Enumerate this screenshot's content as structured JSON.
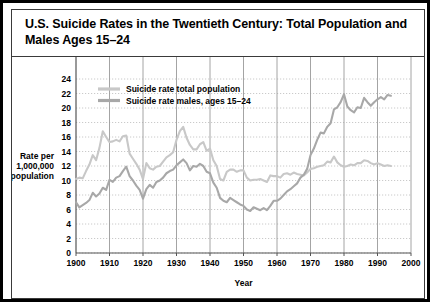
{
  "figure": {
    "title": "U.S. Suicide Rates in the Twentieth Century: Total Population and Males Ages 15–24"
  },
  "chart_data": {
    "type": "line",
    "title": "U.S. Suicide Rates in the Twentieth Century: Total Population and Males Ages 15–24",
    "xlabel": "Year",
    "ylabel": "Rate per 1,000,000 population",
    "ylabel_lines": [
      "Rate per",
      "1,000,000",
      "population"
    ],
    "xlim": [
      1900,
      2000
    ],
    "ylim": [
      0,
      24
    ],
    "xticks": [
      1900,
      1910,
      1920,
      1930,
      1940,
      1950,
      1960,
      1970,
      1980,
      1990,
      2000
    ],
    "yticks": [
      0,
      2,
      4,
      6,
      8,
      10,
      12,
      14,
      16,
      18,
      20,
      22,
      24
    ],
    "grid": "dotted-horizontal-and-solid-vertical",
    "legend_position": "top-left-inside",
    "colors": {
      "total_population": "#c8c8c8",
      "males_15_24": "#a8a8a8",
      "grid": "#bdbdbd",
      "axis": "#555555",
      "frame": "#000000"
    },
    "x": [
      1900,
      1901,
      1902,
      1903,
      1904,
      1905,
      1906,
      1907,
      1908,
      1909,
      1910,
      1911,
      1912,
      1913,
      1914,
      1915,
      1916,
      1917,
      1918,
      1919,
      1920,
      1921,
      1922,
      1923,
      1924,
      1925,
      1926,
      1927,
      1928,
      1929,
      1930,
      1931,
      1932,
      1933,
      1934,
      1935,
      1936,
      1937,
      1938,
      1939,
      1940,
      1941,
      1942,
      1943,
      1944,
      1945,
      1946,
      1947,
      1948,
      1949,
      1950,
      1951,
      1952,
      1953,
      1954,
      1955,
      1956,
      1957,
      1958,
      1959,
      1960,
      1961,
      1962,
      1963,
      1964,
      1965,
      1966,
      1967,
      1968,
      1969,
      1970,
      1971,
      1972,
      1973,
      1974,
      1975,
      1976,
      1977,
      1978,
      1979,
      1980,
      1981,
      1982,
      1983,
      1984,
      1985,
      1986,
      1987,
      1988,
      1989,
      1990,
      1991,
      1992,
      1993,
      1994
    ],
    "series": [
      {
        "name": "Suicide rate total population",
        "values": [
          10.2,
          10.4,
          10.3,
          11.3,
          12.2,
          13.5,
          12.8,
          14.5,
          16.8,
          16.0,
          15.3,
          15.4,
          15.6,
          15.4,
          16.1,
          16.2,
          13.7,
          13.0,
          12.3,
          11.5,
          10.2,
          12.4,
          11.7,
          11.5,
          11.9,
          12.0,
          12.6,
          13.2,
          13.5,
          13.9,
          15.6,
          16.8,
          17.4,
          15.9,
          14.9,
          14.3,
          14.3,
          15.0,
          15.3,
          14.1,
          14.4,
          12.8,
          12.0,
          10.2,
          10.0,
          11.2,
          11.5,
          11.5,
          11.2,
          11.4,
          11.4,
          10.4,
          10.0,
          10.1,
          10.1,
          10.2,
          10.0,
          9.8,
          10.7,
          10.6,
          10.6,
          10.4,
          10.9,
          11.0,
          10.8,
          11.1,
          10.9,
          10.8,
          10.7,
          11.1,
          11.6,
          11.7,
          11.9,
          12.0,
          12.1,
          12.6,
          12.5,
          13.3,
          12.5,
          12.1,
          11.9,
          12.0,
          12.2,
          12.1,
          12.4,
          12.4,
          12.8,
          12.7,
          12.4,
          12.2,
          12.4,
          12.2,
          12.0,
          12.1,
          12.0
        ]
      },
      {
        "name": "Suicide rate males, ages 15–24",
        "values": [
          7.0,
          6.3,
          6.6,
          6.9,
          7.3,
          8.3,
          7.8,
          8.2,
          9.0,
          8.7,
          10.1,
          9.8,
          10.4,
          10.6,
          11.3,
          11.9,
          10.6,
          10.0,
          9.3,
          8.7,
          7.5,
          8.8,
          9.4,
          9.0,
          9.8,
          10.0,
          10.4,
          11.0,
          11.3,
          11.5,
          12.1,
          12.5,
          12.9,
          12.4,
          11.4,
          12.0,
          11.9,
          12.3,
          12.0,
          11.2,
          11.0,
          9.7,
          9.0,
          7.6,
          7.2,
          7.0,
          7.6,
          7.3,
          7.0,
          6.7,
          6.5,
          6.0,
          5.8,
          6.3,
          6.1,
          5.9,
          6.2,
          5.9,
          6.5,
          7.2,
          7.2,
          7.5,
          8.0,
          8.5,
          8.8,
          9.2,
          9.6,
          10.4,
          10.8,
          11.6,
          13.5,
          14.4,
          15.6,
          16.6,
          16.5,
          17.4,
          17.9,
          19.8,
          20.1,
          20.8,
          21.9,
          20.2,
          19.7,
          19.4,
          20.1,
          20.0,
          21.4,
          20.8,
          20.3,
          20.8,
          21.2,
          21.5,
          21.2,
          21.8,
          21.7
        ]
      }
    ]
  }
}
